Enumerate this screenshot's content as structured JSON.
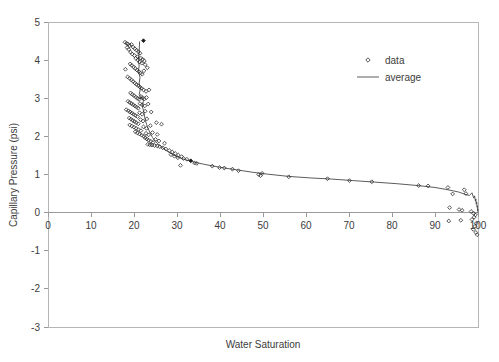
{
  "chart_data": {
    "type": "scatter",
    "title": "",
    "xlabel": "Water Saturation",
    "ylabel": "Capillary Pressure (psi)",
    "xlim": [
      0,
      100
    ],
    "ylim": [
      -3,
      5
    ],
    "xticks": [
      0,
      10,
      20,
      30,
      40,
      50,
      60,
      70,
      80,
      90,
      100
    ],
    "xtick_labels": [
      "0",
      "10",
      "20",
      "30",
      "40",
      "50",
      "60",
      "70",
      "80",
      "90",
      "100"
    ],
    "yticks": [
      -3,
      -2,
      -1,
      0,
      1,
      2,
      3,
      4,
      5
    ],
    "ytick_labels": [
      "-3",
      "-2",
      "-1",
      "0",
      "1",
      "2",
      "3",
      "4",
      "5"
    ],
    "grid": false,
    "legend_position": "upper right",
    "legend": [
      {
        "name": "data",
        "marker": "open-diamond",
        "color": "#2b2b2b"
      },
      {
        "name": "average",
        "marker": "line",
        "color": "#4a4a4a"
      }
    ],
    "series": [
      {
        "name": "data",
        "marker": "open-diamond",
        "points": [
          [
            17.9,
            4.47
          ],
          [
            18.3,
            4.44
          ],
          [
            18.6,
            4.42
          ],
          [
            19.0,
            4.38
          ],
          [
            19.4,
            4.41
          ],
          [
            19.8,
            4.34
          ],
          [
            20.2,
            4.3
          ],
          [
            20.6,
            4.26
          ],
          [
            21.0,
            4.22
          ],
          [
            21.4,
            4.18
          ],
          [
            20.1,
            4.12
          ],
          [
            20.8,
            4.09
          ],
          [
            21.6,
            4.05
          ],
          [
            22.0,
            4.02
          ],
          [
            22.4,
            3.98
          ],
          [
            19.6,
            4.16
          ],
          [
            19.2,
            4.21
          ],
          [
            18.8,
            4.28
          ],
          [
            18.4,
            4.33
          ],
          [
            22.2,
            4.51
          ],
          [
            20.4,
            4.05
          ],
          [
            20.9,
            4.0
          ],
          [
            21.3,
            3.95
          ],
          [
            21.8,
            3.92
          ],
          [
            22.6,
            3.88
          ],
          [
            19.1,
            3.9
          ],
          [
            19.5,
            3.86
          ],
          [
            19.9,
            3.82
          ],
          [
            20.3,
            3.78
          ],
          [
            20.7,
            3.74
          ],
          [
            21.1,
            3.7
          ],
          [
            21.5,
            3.66
          ],
          [
            21.9,
            3.63
          ],
          [
            22.3,
            3.72
          ],
          [
            23.1,
            3.8
          ],
          [
            18.0,
            3.76
          ],
          [
            18.5,
            3.56
          ],
          [
            19.0,
            3.52
          ],
          [
            19.4,
            3.48
          ],
          [
            19.8,
            3.44
          ],
          [
            20.2,
            3.4
          ],
          [
            20.6,
            3.36
          ],
          [
            21.0,
            3.33
          ],
          [
            21.4,
            3.29
          ],
          [
            21.8,
            3.26
          ],
          [
            22.2,
            3.22
          ],
          [
            22.8,
            3.18
          ],
          [
            23.5,
            3.22
          ],
          [
            19.2,
            3.14
          ],
          [
            19.6,
            3.1
          ],
          [
            20.0,
            3.07
          ],
          [
            20.4,
            3.03
          ],
          [
            20.8,
            3.0
          ],
          [
            21.2,
            2.97
          ],
          [
            21.6,
            3.05
          ],
          [
            22.0,
            3.01
          ],
          [
            22.4,
            2.98
          ],
          [
            22.9,
            3.02
          ],
          [
            18.6,
            2.92
          ],
          [
            19.0,
            2.89
          ],
          [
            19.4,
            2.86
          ],
          [
            19.8,
            2.83
          ],
          [
            20.2,
            2.8
          ],
          [
            20.6,
            2.77
          ],
          [
            21.0,
            2.74
          ],
          [
            21.4,
            2.86
          ],
          [
            21.9,
            2.83
          ],
          [
            22.5,
            2.8
          ],
          [
            23.3,
            2.85
          ],
          [
            18.2,
            2.7
          ],
          [
            18.7,
            2.67
          ],
          [
            19.1,
            2.64
          ],
          [
            19.5,
            2.61
          ],
          [
            19.9,
            2.58
          ],
          [
            20.3,
            2.55
          ],
          [
            20.8,
            2.52
          ],
          [
            21.3,
            2.62
          ],
          [
            21.9,
            2.58
          ],
          [
            22.6,
            2.66
          ],
          [
            24.0,
            2.64
          ],
          [
            18.9,
            2.48
          ],
          [
            19.3,
            2.45
          ],
          [
            19.7,
            2.42
          ],
          [
            20.1,
            2.39
          ],
          [
            20.5,
            2.36
          ],
          [
            21.0,
            2.33
          ],
          [
            21.5,
            2.44
          ],
          [
            22.1,
            2.4
          ],
          [
            23.0,
            2.46
          ],
          [
            25.2,
            2.36
          ],
          [
            19.0,
            2.3
          ],
          [
            19.5,
            2.27
          ],
          [
            20.0,
            2.24
          ],
          [
            20.5,
            2.21
          ],
          [
            21.0,
            2.18
          ],
          [
            21.6,
            2.15
          ],
          [
            22.2,
            2.25
          ],
          [
            22.9,
            2.21
          ],
          [
            23.8,
            2.28
          ],
          [
            26.4,
            2.32
          ],
          [
            20.3,
            2.12
          ],
          [
            20.8,
            2.09
          ],
          [
            21.3,
            2.06
          ],
          [
            21.8,
            2.03
          ],
          [
            22.3,
            2.0
          ],
          [
            22.8,
            2.08
          ],
          [
            23.4,
            2.04
          ],
          [
            24.3,
            2.1
          ],
          [
            25.4,
            2.05
          ],
          [
            22.6,
            1.96
          ],
          [
            23.0,
            1.93
          ],
          [
            23.4,
            1.9
          ],
          [
            23.9,
            1.87
          ],
          [
            24.4,
            1.84
          ],
          [
            25.0,
            1.92
          ],
          [
            25.8,
            1.88
          ],
          [
            27.1,
            1.82
          ],
          [
            23.2,
            1.79
          ],
          [
            23.7,
            1.78
          ],
          [
            24.2,
            1.77
          ],
          [
            24.8,
            1.76
          ],
          [
            25.4,
            1.75
          ],
          [
            26.0,
            1.73
          ],
          [
            26.7,
            1.7
          ],
          [
            27.4,
            1.67
          ],
          [
            28.2,
            1.63
          ],
          [
            28.9,
            1.59
          ],
          [
            29.6,
            1.55
          ],
          [
            30.3,
            1.51
          ],
          [
            31.1,
            1.47
          ],
          [
            28.6,
            1.52
          ],
          [
            29.4,
            1.48
          ],
          [
            30.2,
            1.44
          ],
          [
            31.5,
            1.42
          ],
          [
            32.3,
            1.4
          ],
          [
            33.2,
            1.36
          ],
          [
            34.1,
            1.3
          ],
          [
            34.6,
            1.29
          ],
          [
            30.8,
            1.24
          ],
          [
            38.2,
            1.22
          ],
          [
            39.9,
            1.18
          ],
          [
            41.0,
            1.17
          ],
          [
            42.9,
            1.14
          ],
          [
            44.3,
            1.1
          ],
          [
            49.0,
            1.0
          ],
          [
            49.8,
            1.03
          ],
          [
            49.4,
            0.97
          ],
          [
            56.0,
            0.94
          ],
          [
            65.0,
            0.89
          ],
          [
            70.1,
            0.84
          ],
          [
            75.3,
            0.81
          ],
          [
            86.2,
            0.71
          ],
          [
            88.4,
            0.7
          ],
          [
            93.0,
            0.66
          ],
          [
            94.1,
            0.49
          ],
          [
            96.8,
            0.6
          ],
          [
            97.2,
            0.5
          ],
          [
            93.4,
            0.13
          ],
          [
            95.6,
            0.08
          ],
          [
            96.3,
            0.06
          ],
          [
            98.4,
            0.03
          ],
          [
            99.0,
            -0.02
          ],
          [
            99.4,
            -0.06
          ],
          [
            99.1,
            -0.12
          ],
          [
            98.6,
            -0.18
          ],
          [
            93.2,
            -0.22
          ],
          [
            96.0,
            -0.2
          ],
          [
            99.6,
            -0.28
          ],
          [
            99.3,
            -0.36
          ],
          [
            98.9,
            -0.44
          ],
          [
            99.5,
            -0.52
          ],
          [
            99.8,
            -0.58
          ]
        ]
      }
    ],
    "average_line": [
      [
        21.3,
        4.49
      ],
      [
        21.2,
        4.2
      ],
      [
        21.0,
        4.0
      ],
      [
        21.2,
        3.85
      ],
      [
        21.0,
        3.7
      ],
      [
        21.4,
        3.55
      ],
      [
        21.2,
        3.4
      ],
      [
        21.5,
        3.25
      ],
      [
        21.2,
        3.1
      ],
      [
        21.6,
        3.04
      ],
      [
        21.3,
        2.98
      ],
      [
        22.0,
        3.02
      ],
      [
        22.2,
        2.92
      ],
      [
        21.9,
        2.8
      ],
      [
        22.2,
        2.68
      ],
      [
        22.4,
        2.56
      ],
      [
        22.6,
        2.44
      ],
      [
        22.9,
        2.32
      ],
      [
        23.3,
        2.2
      ],
      [
        23.8,
        2.08
      ],
      [
        24.3,
        1.97
      ],
      [
        25.0,
        1.87
      ],
      [
        25.8,
        1.78
      ],
      [
        26.7,
        1.7
      ],
      [
        27.6,
        1.62
      ],
      [
        28.6,
        1.55
      ],
      [
        29.7,
        1.48
      ],
      [
        31.0,
        1.42
      ],
      [
        32.5,
        1.37
      ],
      [
        34.2,
        1.32
      ],
      [
        36.2,
        1.27
      ],
      [
        38.5,
        1.22
      ],
      [
        41.0,
        1.17
      ],
      [
        44.0,
        1.12
      ],
      [
        47.5,
        1.06
      ],
      [
        51.0,
        1.01
      ],
      [
        56.0,
        0.95
      ],
      [
        61.0,
        0.91
      ],
      [
        66.0,
        0.88
      ],
      [
        71.0,
        0.84
      ],
      [
        76.0,
        0.8
      ],
      [
        81.0,
        0.76
      ],
      [
        86.0,
        0.71
      ],
      [
        90.0,
        0.66
      ],
      [
        93.0,
        0.6
      ],
      [
        95.5,
        0.54
      ],
      [
        97.0,
        0.48
      ],
      [
        98.0,
        0.45
      ],
      [
        98.6,
        0.52
      ],
      [
        99.0,
        0.38
      ],
      [
        99.2,
        0.44
      ],
      [
        99.4,
        0.3
      ],
      [
        99.5,
        0.36
      ],
      [
        99.6,
        0.22
      ],
      [
        99.7,
        0.28
      ],
      [
        99.8,
        0.14
      ],
      [
        99.85,
        0.18
      ],
      [
        99.9,
        0.05
      ],
      [
        99.95,
        0.09
      ],
      [
        100.0,
        -0.02
      ]
    ]
  },
  "axes": {
    "y_title": "Capillary Pressure (psi)",
    "x_title": "Water Saturation"
  }
}
